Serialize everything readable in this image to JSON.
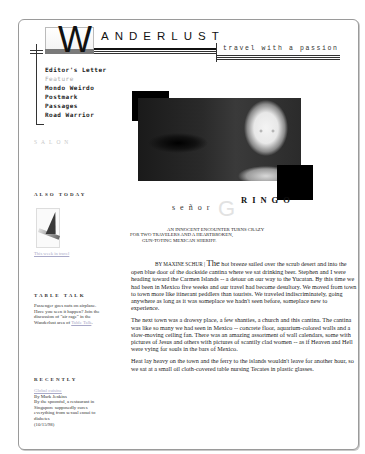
{
  "site": {
    "logo_letter": "W",
    "logo_rest": "ANDERLUST",
    "tagline": "travel with a passion"
  },
  "nav": {
    "items": [
      {
        "label": "Editor's Letter",
        "active": false
      },
      {
        "label": "Feature",
        "active": true
      },
      {
        "label": "Mondo Weirdo",
        "active": false
      },
      {
        "label": "Postmark",
        "active": false
      },
      {
        "label": "Passages",
        "active": false
      },
      {
        "label": "Road Warrior",
        "active": false
      }
    ]
  },
  "sidebar": {
    "salon_label": "SALON",
    "also_today": {
      "heading": "ALSO TODAY",
      "image_icon": "airplane-tail-image",
      "link_text": "This week in travel"
    },
    "table_talk": {
      "heading": "TABLE TALK",
      "text": "Passenger goes nuts on airplane. Have you seen it happen? Join the discussion of \"air rage\" in the Wanderlust area of",
      "link_text": "Table Talk",
      "trailing": "."
    },
    "recently": {
      "heading": "RECENTLY",
      "title": "Global cuisine",
      "byline": "By Mark Jenkins",
      "text": "By the spoonful, a restaurant in Singapore supposedly cures everything from sexual ennui to diabetes",
      "date": "(10/15/98)"
    }
  },
  "feature": {
    "title_prefix": "señor",
    "title_initial": "G",
    "title_rest": "RINGO",
    "dek_lines": [
      "AN INNOCENT ENCOUNTER TURNS CRAZY",
      "FOR TWO TRAVELERS AND A HEARTBROKEN,",
      "GUN-TOTING MEXICAN SHERIFF."
    ],
    "byline": "BY MAXINE SCHUR |",
    "dropcap": "The",
    "paragraphs": [
      " hot breeze sailed over the scrub desert and into the open blue door of the dockside cantina where we sat drinking beer. Stephen and I were heading toward the Carmen Islands -- a detour on our way to the Yucatan. By this time we had been in Mexico five weeks and our travel had become desultory. We moved from town to town more like itinerant peddlers than tourists. We traveled indiscriminately, going anywhere as long as it was someplace we hadn't seen before, someplace new to experience.",
      "The next town was a drowsy place, a few shanties, a church and this cantina. The cantina was like so many we had seen in Mexico -- concrete floor, aquarium-colored walls and a slow-moving ceiling fan. There was an amazing assortment of wall calendars, some with pictures of Jesus and others with pictures of scantily clad women -- as if Heaven and Hell were vying for souls in the bars of Mexico.",
      "Heat lay heavy on the town and the ferry to the islands wouldn't leave for another hour, so we sat at a small oil cloth-covered table nursing Tecates in plastic glasses."
    ]
  },
  "colors": {
    "link_visited": "#a9a9c8",
    "text": "#222222",
    "salon_gray": "#c8c8c8",
    "frame_border": "#9a9a9a"
  }
}
